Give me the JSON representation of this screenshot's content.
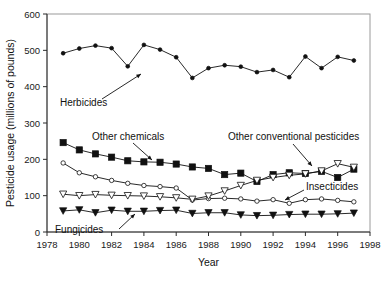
{
  "figure": {
    "background": "#ffffff",
    "ink_color": "#111111"
  },
  "chart_data": {
    "type": "line",
    "title": "",
    "xlabel": "Year",
    "ylabel": "Pesticide usage (millions of pounds)",
    "xlim": [
      1978,
      1998
    ],
    "ylim": [
      0,
      600
    ],
    "xticks": [
      1978,
      1980,
      1982,
      1984,
      1986,
      1988,
      1990,
      1992,
      1994,
      1996,
      1998
    ],
    "yticks": [
      0,
      100,
      200,
      300,
      400,
      500,
      600
    ],
    "grid": false,
    "legend": "inline-annotations",
    "x": [
      1979,
      1980,
      1981,
      1982,
      1983,
      1984,
      1985,
      1986,
      1987,
      1988,
      1989,
      1990,
      1991,
      1992,
      1993,
      1994,
      1995,
      1996,
      1997
    ],
    "series": [
      {
        "name": "Herbicides",
        "marker": "filled-circle",
        "values": [
          492,
          505,
          513,
          506,
          456,
          515,
          502,
          481,
          424,
          451,
          459,
          455,
          440,
          446,
          426,
          483,
          451,
          482,
          472
        ]
      },
      {
        "name": "Other chemicals",
        "marker": "filled-square",
        "values": [
          246,
          226,
          215,
          206,
          196,
          193,
          192,
          187,
          179,
          175,
          158,
          162,
          139,
          158,
          163,
          161,
          167,
          150,
          173
        ]
      },
      {
        "name": "Insecticides",
        "marker": "open-circle",
        "values": [
          190,
          163,
          152,
          142,
          134,
          128,
          125,
          121,
          88,
          92,
          93,
          91,
          85,
          89,
          79,
          89,
          91,
          87,
          83
        ]
      },
      {
        "name": "Other conventional pesticides",
        "marker": "open-triangle-down",
        "values": [
          104,
          100,
          103,
          101,
          100,
          99,
          97,
          94,
          90,
          99,
          113,
          128,
          142,
          150,
          156,
          160,
          168,
          188,
          178
        ]
      },
      {
        "name": "Fungicides",
        "marker": "filled-triangle-down",
        "values": [
          58,
          61,
          53,
          60,
          57,
          57,
          59,
          60,
          51,
          53,
          53,
          47,
          45,
          46,
          48,
          49,
          49,
          50,
          52
        ]
      }
    ],
    "annotations": [
      {
        "text": "Herbicides",
        "points_to": "Herbicides series at 1983"
      },
      {
        "text": "Other chemicals",
        "points_to": "Other chemicals series at 1984"
      },
      {
        "text": "Other conventional pesticides",
        "points_to": "Other conventional pesticides series at 1996"
      },
      {
        "text": "Insecticides",
        "points_to": "Insecticides series at 1993"
      },
      {
        "text": "Fungicides",
        "points_to": "Fungicides series at 1983"
      }
    ]
  }
}
